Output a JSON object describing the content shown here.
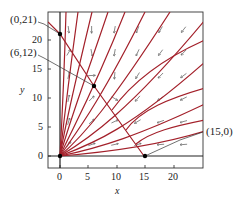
{
  "chart_data": {
    "type": "phase-portrait",
    "title": "",
    "xlabel": "x",
    "ylabel": "y",
    "xlim": [
      -2,
      25
    ],
    "ylim": [
      -2,
      25
    ],
    "xticks": [
      "0",
      "5",
      "10",
      "15",
      "20"
    ],
    "yticks": [
      "0",
      "5",
      "10",
      "15",
      "20"
    ],
    "equilibria": [
      {
        "label": "(0,21)",
        "x": 0,
        "y": 21
      },
      {
        "label": "(6,12)",
        "x": 6,
        "y": 12
      },
      {
        "label": "(15,0)",
        "x": 15,
        "y": 0
      },
      {
        "label": "",
        "x": 0,
        "y": 0
      }
    ],
    "colors": {
      "trajectory": "#a3202a",
      "axis": "#222222",
      "arrow": "#444444"
    }
  },
  "labels": {
    "eq_0_21": "(0,21)",
    "eq_6_12": "(6,12)",
    "eq_15_0": "(15,0)",
    "xlabel": "x",
    "ylabel": "y",
    "xtick0": "0",
    "xtick5": "5",
    "xtick10": "10",
    "xtick15": "15",
    "xtick20": "20",
    "ytick0": "0",
    "ytick5": "5",
    "ytick10": "10",
    "ytick15": "15",
    "ytick20": "20"
  }
}
